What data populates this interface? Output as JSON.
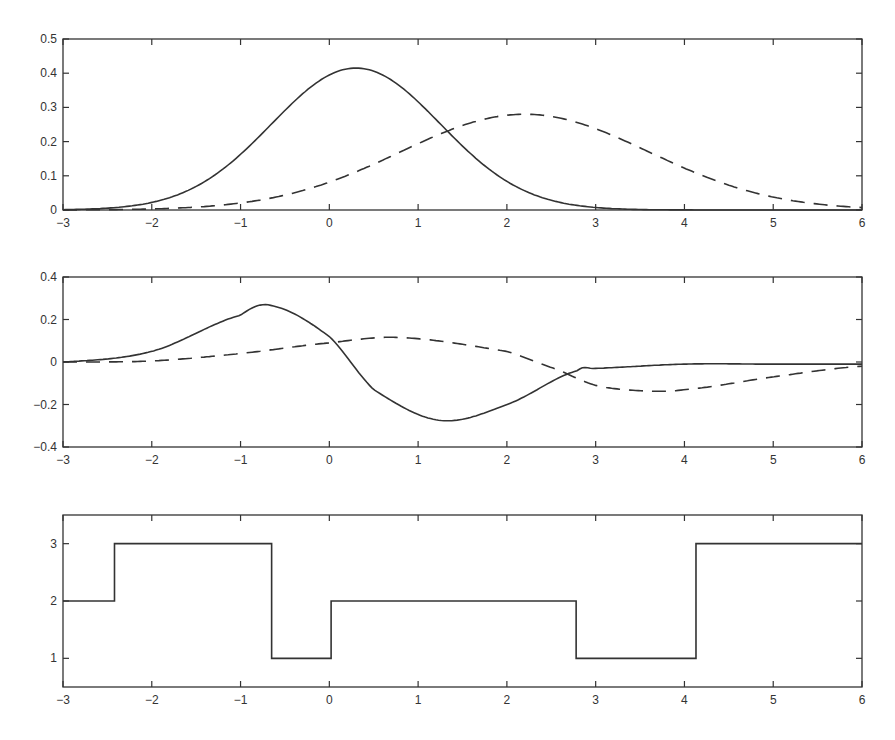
{
  "chart_data": [
    {
      "type": "line",
      "title": "",
      "xlabel": "",
      "ylabel": "",
      "xlim": [
        -3,
        6
      ],
      "ylim": [
        0,
        0.5
      ],
      "xticks": [
        "-3",
        "-2",
        "-1",
        "0",
        "1",
        "2",
        "3",
        "4",
        "5",
        "6"
      ],
      "yticks": [
        "0",
        "0.1",
        "0.2",
        "0.3",
        "0.4",
        "0.5"
      ],
      "grid": false,
      "series": [
        {
          "name": "solid",
          "style": "solid",
          "kind": "gaussian",
          "peak_x": 0.3,
          "peak_y": 0.415,
          "sigma": 0.95,
          "x": [
            -3,
            -2,
            -1,
            0,
            0.3,
            1,
            2,
            3,
            4,
            5,
            6
          ],
          "values": [
            0.0,
            0.022,
            0.16,
            0.39,
            0.415,
            0.31,
            0.085,
            0.007,
            0.0,
            0.0,
            0.0
          ]
        },
        {
          "name": "dashed",
          "style": "dashed",
          "kind": "gaussian",
          "peak_x": 2.2,
          "peak_y": 0.28,
          "sigma": 1.4,
          "x": [
            -3,
            -2,
            -1,
            0,
            1,
            2,
            2.2,
            3,
            4,
            5,
            6
          ],
          "values": [
            0.0,
            0.003,
            0.021,
            0.08,
            0.19,
            0.277,
            0.28,
            0.24,
            0.12,
            0.04,
            0.0
          ]
        }
      ]
    },
    {
      "type": "line",
      "title": "",
      "xlabel": "",
      "ylabel": "",
      "xlim": [
        -3,
        6
      ],
      "ylim": [
        -0.4,
        0.4
      ],
      "xticks": [
        "-3",
        "-2",
        "-1",
        "0",
        "1",
        "2",
        "3",
        "4",
        "5",
        "6"
      ],
      "yticks": [
        "-0.4",
        "-0.2",
        "0",
        "0.2",
        "0.4"
      ],
      "grid": false,
      "series": [
        {
          "name": "solid",
          "style": "solid",
          "x": [
            -3,
            -2,
            -1,
            -0.65,
            0,
            0.5,
            1.25,
            2,
            2.8,
            3,
            4,
            5,
            6
          ],
          "values": [
            0.0,
            0.05,
            0.22,
            0.265,
            0.12,
            -0.13,
            -0.275,
            -0.2,
            -0.04,
            -0.03,
            -0.01,
            -0.01,
            -0.01
          ]
        },
        {
          "name": "dashed",
          "style": "dashed",
          "x": [
            -3,
            -2,
            -1,
            0,
            0.8,
            2,
            2.6,
            3,
            3.5,
            4,
            5,
            6
          ],
          "values": [
            0.0,
            0.005,
            0.04,
            0.09,
            0.115,
            0.05,
            -0.04,
            -0.11,
            -0.135,
            -0.13,
            -0.07,
            -0.02
          ]
        }
      ]
    },
    {
      "type": "line",
      "title": "",
      "xlabel": "",
      "ylabel": "",
      "xlim": [
        -3,
        6
      ],
      "ylim": [
        0.5,
        3.5
      ],
      "xticks": [
        "-3",
        "-2",
        "-1",
        "0",
        "1",
        "2",
        "3",
        "4",
        "5",
        "6"
      ],
      "yticks": [
        "1",
        "2",
        "3"
      ],
      "grid": false,
      "series": [
        {
          "name": "step",
          "style": "solid",
          "kind": "step",
          "breakpoints": [
            -3,
            -2.42,
            -0.65,
            0.02,
            2.78,
            4.13,
            6
          ],
          "values": [
            2,
            3,
            1,
            2,
            1,
            3
          ]
        }
      ]
    }
  ]
}
